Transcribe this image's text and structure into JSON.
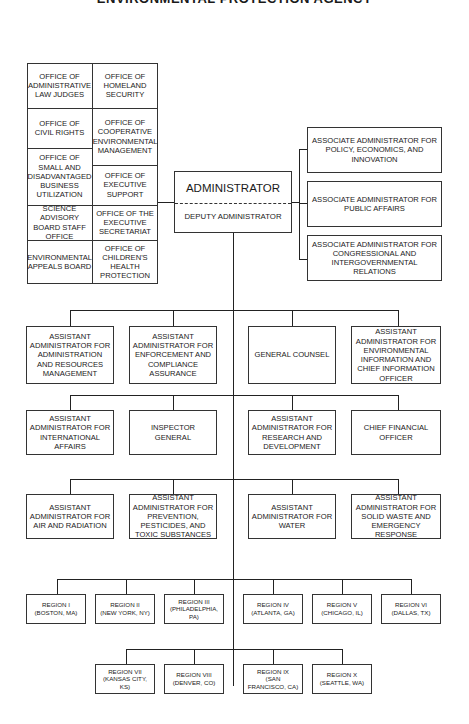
{
  "title": "ENVIRONMENTAL PROTECTION AGENCY",
  "staff_offices": {
    "left_column": [
      {
        "label": "OFFICE OF ADMINISTRATIVE LAW JUDGES"
      },
      {
        "label": "OFFICE OF CIVIL RIGHTS"
      },
      {
        "label": "OFFICE OF SMALL AND DISADVANTAGED BUSINESS UTILIZATION"
      },
      {
        "label": "SCIENCE ADVISORY BOARD STAFF OFFICE"
      },
      {
        "label": "ENVIRONMENTAL APPEALS BOARD"
      }
    ],
    "right_column": [
      {
        "label": "OFFICE OF HOMELAND SECURITY"
      },
      {
        "label": "OFFICE OF COOPERATIVE ENVIRONMENTAL MANAGEMENT"
      },
      {
        "label": "OFFICE OF EXECUTIVE SUPPORT"
      },
      {
        "label": "OFFICE OF THE EXECUTIVE SECRETARIAT"
      },
      {
        "label": "OFFICE OF CHILDREN'S HEALTH PROTECTION"
      }
    ]
  },
  "administrator": {
    "title": "ADMINISTRATOR",
    "deputy": "DEPUTY ADMINISTRATOR"
  },
  "associate_administrators": [
    {
      "label": "ASSOCIATE ADMINISTRATOR FOR POLICY, ECONOMICS, AND INNOVATION"
    },
    {
      "label": "ASSOCIATE ADMINISTRATOR FOR PUBLIC AFFAIRS"
    },
    {
      "label": "ASSOCIATE ADMINISTRATOR FOR CONGRESSIONAL AND INTERGOVERNMENTAL RELATIONS"
    }
  ],
  "row1": [
    {
      "label": "ASSISTANT ADMINISTRATOR FOR ADMINISTRATION AND RESOURCES MANAGEMENT"
    },
    {
      "label": "ASSISTANT ADMINISTRATOR FOR ENFORCEMENT AND COMPLIANCE ASSURANCE"
    },
    {
      "label": "GENERAL COUNSEL"
    },
    {
      "label": "ASSISTANT ADMINISTRATOR FOR ENVIRONMENTAL INFORMATION AND CHIEF INFORMATION OFFICER"
    }
  ],
  "row2": [
    {
      "label": "ASSISTANT ADMINISTRATOR FOR INTERNATIONAL AFFAIRS"
    },
    {
      "label": "INSPECTOR GENERAL"
    },
    {
      "label": "ASSISTANT ADMINISTRATOR FOR RESEARCH AND DEVELOPMENT"
    },
    {
      "label": "CHIEF FINANCIAL OFFICER"
    }
  ],
  "row3": [
    {
      "label": "ASSISTANT ADMINISTRATOR FOR AIR AND RADIATION"
    },
    {
      "label": "ASSISTANT ADMINISTRATOR FOR PREVENTION, PESTICIDES, AND TOXIC SUBSTANCES"
    },
    {
      "label": "ASSISTANT ADMINISTRATOR FOR WATER"
    },
    {
      "label": "ASSISTANT ADMINISTRATOR FOR SOLID WASTE AND EMERGENCY RESPONSE"
    }
  ],
  "regions_row1": [
    {
      "name": "REGION I",
      "city": "(BOSTON, MA)"
    },
    {
      "name": "REGION II",
      "city": "(NEW YORK, NY)"
    },
    {
      "name": "REGION III",
      "city": "(PHILADELPHIA, PA)"
    },
    {
      "name": "REGION IV",
      "city": "(ATLANTA, GA)"
    },
    {
      "name": "REGION V",
      "city": "(CHICAGO, IL)"
    },
    {
      "name": "REGION VI",
      "city": "(DALLAS, TX)"
    }
  ],
  "regions_row2": [
    {
      "name": "REGION VII",
      "city": "(KANSAS CITY, KS)"
    },
    {
      "name": "REGION VIII",
      "city": "(DENVER, CO)"
    },
    {
      "name": "REGION IX",
      "city": "(SAN FRANCISCO, CA)"
    },
    {
      "name": "REGION X",
      "city": "(SEATTLE, WA)"
    }
  ]
}
